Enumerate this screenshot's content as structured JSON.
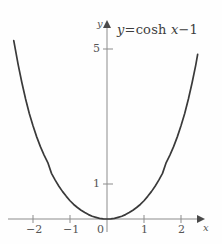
{
  "figure": {
    "background_color": "#fefefe",
    "curve_color": "#3a3a3a",
    "axis_color": "#8c8c8c",
    "text_color": "#4a4a4a"
  },
  "annotation": {
    "equation_full": "y = cosh x − 1",
    "equation_lhs": "y",
    "equation_eq": "=",
    "equation_fn": "cosh",
    "equation_var": "x",
    "equation_minus": "−",
    "equation_const": "1"
  },
  "axes": {
    "x_axis_name": "x",
    "y_axis_name": "y",
    "origin_label": "0"
  },
  "chart_data": {
    "type": "line",
    "xlabel": "x",
    "ylabel": "y",
    "xlim": [
      -2.6,
      2.45
    ],
    "ylim": [
      -0.35,
      6.2
    ],
    "grid": false,
    "legend": null,
    "xticks": [
      -2,
      -1,
      0,
      1,
      2
    ],
    "xtick_labels": [
      "−2",
      "−1",
      "0",
      "1",
      "2"
    ],
    "yticks": [
      1,
      5
    ],
    "ytick_labels": [
      "1",
      "5"
    ],
    "annotations": [
      {
        "text": "y = cosh x − 1",
        "x": 0.75,
        "y": 5.8
      }
    ],
    "series": [
      {
        "name": "y = cosh x − 1",
        "color": "#3a3a3a",
        "x": [
          -2.52,
          -2.4,
          -2.3,
          -2.2,
          -2.1,
          -2.0,
          -1.9,
          -1.8,
          -1.7,
          -1.6,
          -1.5,
          -1.4,
          -1.3,
          -1.2,
          -1.1,
          -1.0,
          -0.9,
          -0.8,
          -0.7,
          -0.6,
          -0.5,
          -0.4,
          -0.3,
          -0.2,
          -0.1,
          0.0,
          0.1,
          0.2,
          0.3,
          0.4,
          0.5,
          0.6,
          0.7,
          0.8,
          0.9,
          1.0,
          1.1,
          1.2,
          1.3,
          1.4,
          1.5,
          1.6,
          1.7,
          1.8,
          1.9,
          2.0,
          2.1,
          2.2,
          2.3,
          2.4,
          2.45
        ],
        "y": [
          5.28,
          4.56,
          4.03,
          3.55,
          3.12,
          2.76,
          2.43,
          2.14,
          1.89,
          1.67,
          1.35,
          1.15,
          0.97,
          0.81,
          0.67,
          0.54,
          0.43,
          0.34,
          0.26,
          0.19,
          0.13,
          0.08,
          0.05,
          0.02,
          0.005,
          0.0,
          0.005,
          0.02,
          0.05,
          0.08,
          0.13,
          0.19,
          0.26,
          0.34,
          0.43,
          0.54,
          0.67,
          0.81,
          0.97,
          1.15,
          1.35,
          1.67,
          1.89,
          2.14,
          2.43,
          2.76,
          3.12,
          3.55,
          4.03,
          4.56,
          4.87
        ]
      }
    ]
  }
}
